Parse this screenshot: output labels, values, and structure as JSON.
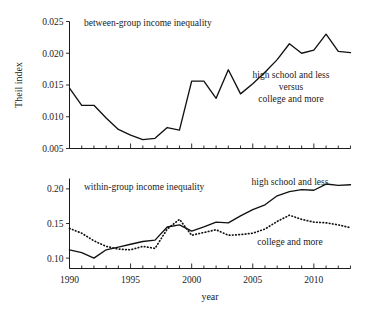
{
  "figure": {
    "xlabel": "year",
    "ylabel": "Theil index"
  },
  "chart_data": [
    {
      "type": "line",
      "panel": "top",
      "title": "between-group income inequality",
      "xlabel": "",
      "ylabel": "Theil index",
      "xlim": [
        1990,
        2013
      ],
      "ylim": [
        0.005,
        0.025
      ],
      "yticks": [
        0.005,
        0.01,
        0.015,
        0.02,
        0.025
      ],
      "ytick_labels": [
        "0.005",
        "0.010",
        "0.015",
        "0.020",
        "0.025"
      ],
      "xticks": [
        1990,
        1995,
        2000,
        2005,
        2010
      ],
      "xtick_labels": [
        "1990",
        "1995",
        "2000",
        "2005",
        "2010"
      ],
      "minor_xticks": "every year",
      "grid": false,
      "legend": "annotation",
      "annotations": [
        {
          "text_lines": [
            "high school and less",
            "versus",
            "college and more"
          ],
          "x": 2006,
          "y": 0.0133
        }
      ],
      "x": [
        1990,
        1991,
        1992,
        1993,
        1994,
        1995,
        1996,
        1997,
        1998,
        1999,
        2000,
        2001,
        2002,
        2003,
        2004,
        2005,
        2006,
        2007,
        2008,
        2009,
        2010,
        2011,
        2012,
        2013
      ],
      "series": [
        {
          "name": "high school and less versus college and more",
          "style": "solid",
          "values": [
            0.0145,
            0.0118,
            0.0118,
            0.0098,
            0.008,
            0.0071,
            0.0064,
            0.0066,
            0.0083,
            0.0079,
            0.0156,
            0.0156,
            0.0129,
            0.0174,
            0.0136,
            0.0152,
            0.017,
            0.019,
            0.0215,
            0.02,
            0.0205,
            0.023,
            0.0203,
            0.0201
          ]
        }
      ]
    },
    {
      "type": "line",
      "panel": "bottom",
      "title": "within-group income inequality",
      "xlabel": "year",
      "ylabel": "Theil index",
      "xlim": [
        1990,
        2013
      ],
      "ylim": [
        0.085,
        0.215
      ],
      "yticks": [
        0.1,
        0.15,
        0.2
      ],
      "ytick_labels": [
        "0.10",
        "0.15",
        "0.20"
      ],
      "xticks": [
        1990,
        1995,
        2000,
        2005,
        2010
      ],
      "xtick_labels": [
        "1990",
        "1995",
        "2000",
        "2005",
        "2010"
      ],
      "minor_xticks": "every year",
      "grid": false,
      "legend": "annotation",
      "annotations": [
        {
          "text_lines": [
            "high school and less"
          ],
          "x": 2009.6,
          "y": 0.213
        },
        {
          "text_lines": [
            "college and more"
          ],
          "x": 2009.0,
          "y": 0.131
        }
      ],
      "x": [
        1990,
        1991,
        1992,
        1993,
        1994,
        1995,
        1996,
        1997,
        1998,
        1999,
        2000,
        2001,
        2002,
        2003,
        2004,
        2005,
        2006,
        2007,
        2008,
        2009,
        2010,
        2011,
        2012,
        2013
      ],
      "series": [
        {
          "name": "high school and less",
          "style": "solid",
          "values": [
            0.112,
            0.108,
            0.1,
            0.112,
            0.116,
            0.12,
            0.124,
            0.126,
            0.145,
            0.148,
            0.139,
            0.145,
            0.152,
            0.151,
            0.161,
            0.17,
            0.177,
            0.19,
            0.196,
            0.199,
            0.198,
            0.207,
            0.205,
            0.206
          ]
        },
        {
          "name": "college and more",
          "style": "dotted",
          "values": [
            0.143,
            0.136,
            0.125,
            0.117,
            0.113,
            0.112,
            0.117,
            0.114,
            0.142,
            0.156,
            0.133,
            0.137,
            0.141,
            0.133,
            0.134,
            0.136,
            0.142,
            0.153,
            0.162,
            0.156,
            0.152,
            0.151,
            0.148,
            0.144
          ]
        }
      ]
    }
  ]
}
